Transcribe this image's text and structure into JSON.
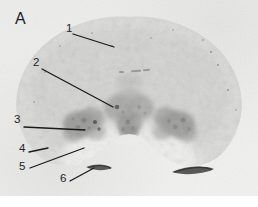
{
  "figure": {
    "panel_letter": "A",
    "modality": "coronal-brain-section-autoradiograph",
    "background_color": "#eeeeed",
    "tissue_color": "#d8d8d6",
    "label_color": "#242424",
    "leader_line_color": "#1a1a1a"
  },
  "annotations": [
    {
      "id": "label-1",
      "text": "1",
      "label_x": 66,
      "label_y": 29,
      "leader": {
        "x1": 73,
        "y1": 34,
        "x2": 114,
        "y2": 47
      }
    },
    {
      "id": "label-2",
      "text": "2",
      "label_x": 33,
      "label_y": 63,
      "leader": {
        "x1": 42,
        "y1": 69,
        "x2": 113,
        "y2": 107
      }
    },
    {
      "id": "label-3",
      "text": "3",
      "label_x": 14,
      "label_y": 120,
      "leader": {
        "x1": 24,
        "y1": 127,
        "x2": 85,
        "y2": 130
      }
    },
    {
      "id": "label-4",
      "text": "4",
      "label_x": 19,
      "label_y": 149,
      "leader": {
        "x1": 29,
        "y1": 152,
        "x2": 48,
        "y2": 148
      }
    },
    {
      "id": "label-5",
      "text": "5",
      "label_x": 19,
      "label_y": 167,
      "leader": {
        "x1": 30,
        "y1": 168,
        "x2": 84,
        "y2": 148
      }
    },
    {
      "id": "label-6",
      "text": "6",
      "label_x": 60,
      "label_y": 179,
      "leader": {
        "x1": 70,
        "y1": 181,
        "x2": 94,
        "y2": 168
      }
    }
  ]
}
